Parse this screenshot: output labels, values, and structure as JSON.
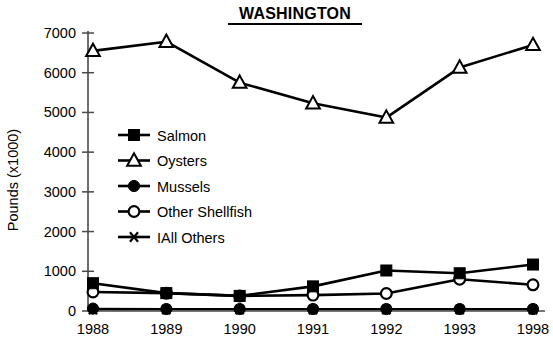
{
  "chart_data": {
    "type": "line",
    "title": "WASHINGTON",
    "xlabel": "",
    "ylabel": "Pounds (x1000)",
    "categories": [
      "1988",
      "1989",
      "1990",
      "1991",
      "1992",
      "1993",
      "1998"
    ],
    "ylim": [
      0,
      7000
    ],
    "yticks": [
      0,
      1000,
      2000,
      3000,
      4000,
      5000,
      6000,
      7000
    ],
    "ytick_labels": [
      "0",
      "1000",
      "2000",
      "3000",
      "4000",
      "5000",
      "6000",
      "7000"
    ],
    "grid": false,
    "legend_position": "center-left",
    "series": [
      {
        "name": "Salmon",
        "marker": "filled-square",
        "values": [
          700,
          450,
          380,
          620,
          1020,
          950,
          1170
        ]
      },
      {
        "name": "Oysters",
        "marker": "open-triangle",
        "values": [
          6550,
          6780,
          5750,
          5230,
          4870,
          6130,
          6700
        ]
      },
      {
        "name": "Mussels",
        "marker": "filled-circle",
        "values": [
          60,
          50,
          50,
          50,
          50,
          50,
          50
        ]
      },
      {
        "name": "Other Shellfish",
        "marker": "open-circle",
        "values": [
          480,
          450,
          380,
          400,
          440,
          800,
          660
        ]
      },
      {
        "name": "IAll Others",
        "marker": "asterisk",
        "values": [
          40,
          40,
          40,
          40,
          40,
          40,
          40
        ]
      }
    ]
  },
  "chart": {
    "title": "WASHINGTON",
    "y_axis_label": "Pounds (x1000)",
    "y_tick_labels": [
      "7000",
      "6000",
      "5000",
      "4000",
      "3000",
      "2000",
      "1000",
      "0"
    ],
    "x_tick_labels": [
      "1988",
      "1989",
      "1990",
      "1991",
      "1992",
      "1993",
      "1998"
    ],
    "legend": [
      {
        "label": "Salmon",
        "marker": "filled-square-marker"
      },
      {
        "label": "Oysters",
        "marker": "open-triangle-marker"
      },
      {
        "label": "Mussels",
        "marker": "filled-circle-marker"
      },
      {
        "label": "Other Shellfish",
        "marker": "open-circle-marker"
      },
      {
        "label": "IAll Others",
        "marker": "asterisk-marker"
      }
    ],
    "colors": {
      "ink": "#000000",
      "background": "#ffffff",
      "axis": "#3a3a3a"
    }
  }
}
